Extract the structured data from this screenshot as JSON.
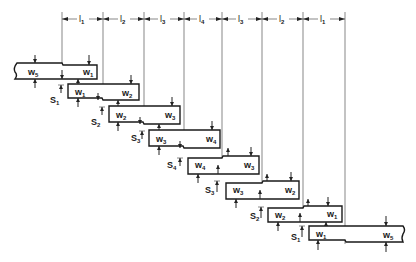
{
  "figure": {
    "type": "stepped beam / shaft segment diagram",
    "stroke_color": "#1a1a1a",
    "background": "#ffffff"
  },
  "dimension_labels": [
    {
      "name": "l",
      "sub": "1"
    },
    {
      "name": "l",
      "sub": "2"
    },
    {
      "name": "l",
      "sub": "3"
    },
    {
      "name": "l",
      "sub": "4"
    },
    {
      "name": "l",
      "sub": "3"
    },
    {
      "name": "l",
      "sub": "2"
    },
    {
      "name": "l",
      "sub": "1"
    }
  ],
  "guide_lines_x": [
    62,
    103,
    144,
    184,
    222,
    262,
    303,
    345
  ],
  "segments": [
    {
      "left": {
        "name": "w",
        "sub": "5"
      },
      "right": {
        "name": "w",
        "sub": "1"
      },
      "offset": null
    },
    {
      "left": {
        "name": "w",
        "sub": "1"
      },
      "right": {
        "name": "w",
        "sub": "2"
      },
      "offset": {
        "name": "S",
        "sub": "1"
      }
    },
    {
      "left": {
        "name": "w",
        "sub": "2"
      },
      "right": {
        "name": "w",
        "sub": "3"
      },
      "offset": {
        "name": "S",
        "sub": "2"
      }
    },
    {
      "left": {
        "name": "w",
        "sub": "3"
      },
      "right": {
        "name": "w",
        "sub": "4"
      },
      "offset": {
        "name": "S",
        "sub": "3"
      }
    },
    {
      "left": {
        "name": "w",
        "sub": "4"
      },
      "right": {
        "name": "w",
        "sub": "3"
      },
      "offset": {
        "name": "S",
        "sub": "4"
      }
    },
    {
      "left": {
        "name": "w",
        "sub": "3"
      },
      "right": {
        "name": "w",
        "sub": "2"
      },
      "offset": {
        "name": "S",
        "sub": "3"
      }
    },
    {
      "left": {
        "name": "w",
        "sub": "2"
      },
      "right": {
        "name": "w",
        "sub": "1"
      },
      "offset": {
        "name": "S",
        "sub": "2"
      }
    },
    {
      "left": {
        "name": "w",
        "sub": "1"
      },
      "right": {
        "name": "w",
        "sub": "5"
      },
      "offset": {
        "name": "S",
        "sub": "1"
      }
    }
  ]
}
